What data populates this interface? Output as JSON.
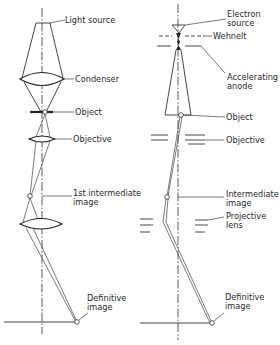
{
  "diagram": {
    "left_panel": {
      "title": "Light microscope",
      "labels": {
        "light_source": "Light source",
        "condenser": "Condenser",
        "object": "Object",
        "objective": "Objective",
        "intermediate_line1": "1st intermediate",
        "intermediate_line2": "image",
        "definitive_line1": "Definitive",
        "definitive_line2": "image"
      }
    },
    "right_panel": {
      "title": "Electron microscope",
      "labels": {
        "source_line1": "Electron",
        "source_line2": "source",
        "wehnelt": "Wehnelt",
        "anode_line1": "Accelerating",
        "anode_line2": "anode",
        "object": "Object",
        "objective": "Objective",
        "intermediate_line1": "Intermediate",
        "intermediate_line2": "image",
        "projective_line1": "Projective",
        "projective_line2": "lens",
        "definitive_line1": "Definitive",
        "definitive_line2": "image"
      }
    },
    "colors": {
      "ink": "#2a2a2a",
      "background": "#ffffff"
    }
  }
}
